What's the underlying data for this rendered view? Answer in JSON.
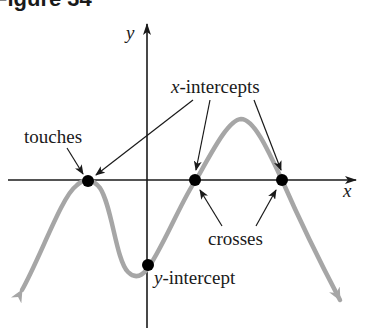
{
  "figure": {
    "title": "Figure 34"
  },
  "axes": {
    "x_label": "x",
    "y_label": "y"
  },
  "annotations": {
    "touches": "touches",
    "x_intercepts_var": "x",
    "x_intercepts_rest": "-intercepts",
    "crosses": "crosses",
    "y_intercept_var": "y",
    "y_intercept_rest": "-intercept"
  },
  "points": [
    {
      "name": "touches-point",
      "type": "touches x-axis",
      "px": [
        88,
        181
      ]
    },
    {
      "name": "x-intercept-1",
      "type": "crosses x-axis",
      "px": [
        195,
        180
      ]
    },
    {
      "name": "x-intercept-2",
      "type": "crosses x-axis",
      "px": [
        282,
        180
      ]
    },
    {
      "name": "y-intercept",
      "type": "y-intercept",
      "px": [
        148,
        265
      ]
    }
  ],
  "colors": {
    "curve": "#a6a6a6",
    "axis": "#1a1a1a",
    "point": "#000000"
  }
}
